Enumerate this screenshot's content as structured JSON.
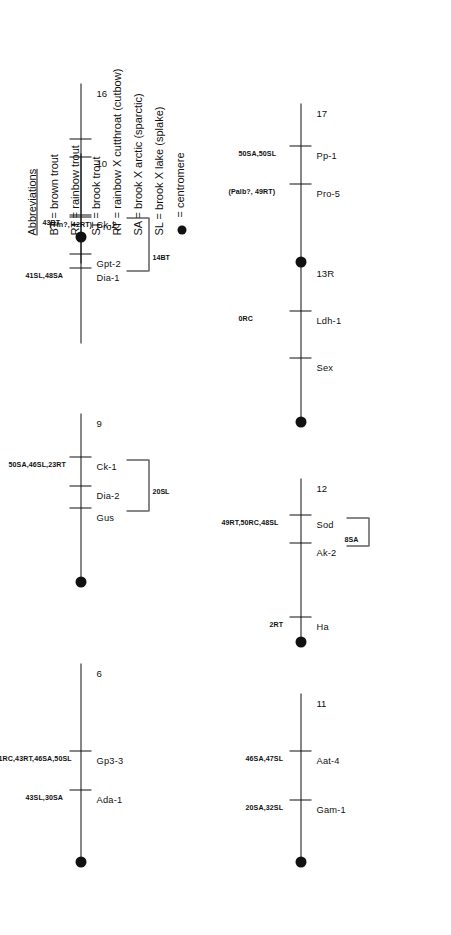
{
  "figure": {
    "kind": "genetic-linkage-map"
  },
  "legend": {
    "title": "Abbreviations",
    "entries": [
      "BT = brown trout",
      "RT = rainbow trout",
      "ST = brook trout",
      "RT = rainbow X cutthroat (cutbow)",
      "SA = brook X arctic (sparctic)",
      "SL = brook X lake (splake)"
    ],
    "centromere_label": "= centromere",
    "centromere_color": "#111111"
  },
  "groups": [
    {
      "id": "6",
      "number_label": "6",
      "has_centromere": true,
      "end_label": "",
      "markers": [
        {
          "gene": "Ada-1",
          "distance": "43SL,30SA"
        },
        {
          "gene": "Gp3-3",
          "distance": "41RC,43RT,46SA,50SL"
        }
      ],
      "brackets": []
    },
    {
      "id": "9",
      "number_label": "9",
      "has_centromere": true,
      "end_label": "",
      "markers": [
        {
          "gene": "Gus",
          "distance": ""
        },
        {
          "gene": "Dia-2",
          "distance": ""
        },
        {
          "gene": "Ck-1",
          "distance": "50SA,46SL,23RT"
        }
      ],
      "brackets": [
        {
          "from": "Gus",
          "to": "Ck-1",
          "label": "20SL"
        }
      ]
    },
    {
      "id": "10",
      "number_label": "10",
      "has_centromere": false,
      "end_label": "",
      "markers": [
        {
          "gene": "Dia-1",
          "distance": "41SL,48SA"
        },
        {
          "gene": "Ck-2",
          "distance": "43BT"
        }
      ],
      "brackets": [
        {
          "from": "Dia-1",
          "to": "Ck-2",
          "label": "14BT"
        }
      ]
    },
    {
      "id": "11",
      "number_label": "11",
      "has_centromere": true,
      "end_label": "",
      "markers": [
        {
          "gene": "Gam-1",
          "distance": "20SA,32SL"
        },
        {
          "gene": "Aat-4",
          "distance": "46SA,47SL"
        }
      ],
      "brackets": []
    },
    {
      "id": "12",
      "number_label": "12",
      "has_centromere": true,
      "end_label": "",
      "markers": [
        {
          "gene": "Ha",
          "distance": "2RT"
        },
        {
          "gene": "Ak-2",
          "distance": ""
        },
        {
          "gene": "Sod",
          "distance": "49RT,50RC,48SL"
        }
      ],
      "brackets": [
        {
          "from": "Ak-2",
          "to": "Sod",
          "label": "8SA"
        }
      ]
    },
    {
      "id": "13R",
      "number_label": "13R",
      "has_centromere": true,
      "end_label": "1BL",
      "markers": [
        {
          "gene": "Sex",
          "distance": ""
        },
        {
          "gene": "Ldh-1",
          "distance": "0RC"
        },
        {
          "gene": "Aat-5",
          "distance": "36SL"
        },
        {
          "gene": "Gpi-3",
          "distance": "49SA,48SL"
        }
      ],
      "brackets": []
    },
    {
      "id": "16",
      "number_label": "16",
      "has_centromere": true,
      "end_label": "",
      "markers": [
        {
          "gene": "Gpt-2",
          "distance": "27SA"
        },
        {
          "gene": "Pro-2",
          "distance": "(Tfn?, 42RT)"
        }
      ],
      "brackets": []
    },
    {
      "id": "17",
      "number_label": "17",
      "has_centromere": true,
      "end_label": "",
      "markers": [
        {
          "gene": "Pro-5",
          "distance": "(Palb?, 49RT)"
        },
        {
          "gene": "Pp-1",
          "distance": "50SA,50SL"
        }
      ],
      "brackets": []
    }
  ]
}
